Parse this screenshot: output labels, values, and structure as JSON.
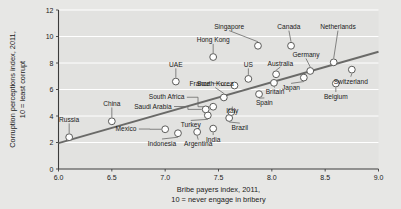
{
  "chart_data": {
    "type": "scatter",
    "title": "",
    "xlabel": "Bribe payers index, 2011,\n10 = never engage in bribery",
    "xlabel_line1": "Bribe payers index, 2011,",
    "xlabel_line2": "10 = never engage in bribery",
    "ylabel_line1": "Corruption perceptions index, 2011,",
    "ylabel_line2": "10 = least corrupt",
    "xlim": [
      6.0,
      9.0
    ],
    "ylim": [
      0,
      12
    ],
    "xticks": [
      "6.0",
      "6.5",
      "7.0",
      "7.5",
      "8.0",
      "8.5",
      "9.0"
    ],
    "xtick_values": [
      6.0,
      6.5,
      7.0,
      7.5,
      8.0,
      8.5,
      9.0
    ],
    "yticks": [
      "0",
      "2",
      "4",
      "6",
      "8",
      "10",
      "12"
    ],
    "ytick_values": [
      0,
      2,
      4,
      6,
      8,
      10,
      12
    ],
    "grid": "horizontal-white",
    "legend": "none",
    "plot_bg": "#e2e2e0",
    "marker_fill": "#ffffff",
    "marker_stroke": "#5a5a58",
    "trendline_color": "#6a6a68",
    "trendline": {
      "x0": 6.0,
      "y0": 1.95,
      "x1": 9.0,
      "y1": 8.85
    },
    "points": [
      {
        "label": "Russia",
        "x": 6.1,
        "y": 2.4,
        "lx": 6.1,
        "ly": 3.55,
        "anchor": "middle"
      },
      {
        "label": "China",
        "x": 6.5,
        "y": 3.6,
        "lx": 6.5,
        "ly": 4.75,
        "anchor": "middle"
      },
      {
        "label": "Mexico",
        "x": 7.0,
        "y": 3.0,
        "lx": 6.73,
        "ly": 2.85,
        "anchor": "end"
      },
      {
        "label": "Indonesia",
        "x": 7.12,
        "y": 2.7,
        "lx": 6.97,
        "ly": 1.75,
        "anchor": "middle"
      },
      {
        "label": "Argentina",
        "x": 7.3,
        "y": 2.8,
        "lx": 7.31,
        "ly": 1.7,
        "anchor": "middle"
      },
      {
        "label": "India",
        "x": 7.45,
        "y": 3.05,
        "lx": 7.45,
        "ly": 2.05,
        "anchor": "middle"
      },
      {
        "label": "Turkey",
        "x": 7.4,
        "y": 4.05,
        "lx": 7.24,
        "ly": 3.15,
        "anchor": "middle"
      },
      {
        "label": "Saudi Arabia",
        "x": 7.38,
        "y": 4.5,
        "lx": 7.06,
        "ly": 4.55,
        "anchor": "end"
      },
      {
        "label": "South Africa",
        "x": 7.45,
        "y": 4.7,
        "lx": 7.18,
        "ly": 5.25,
        "anchor": "end"
      },
      {
        "label": "Brazil",
        "x": 7.6,
        "y": 3.85,
        "lx": 7.7,
        "ly": 2.95,
        "anchor": "middle"
      },
      {
        "label": "Italy",
        "x": 7.62,
        "y": 4.3,
        "lx": 7.63,
        "ly": 4.2,
        "anchor": "middle"
      },
      {
        "label": "South Korea",
        "x": 7.55,
        "y": 5.4,
        "lx": 7.47,
        "ly": 6.25,
        "anchor": "middle"
      },
      {
        "label": "Spain",
        "x": 7.88,
        "y": 5.65,
        "lx": 7.93,
        "ly": 4.85,
        "anchor": "middle"
      },
      {
        "label": "France",
        "x": 7.65,
        "y": 6.3,
        "lx": 7.42,
        "ly": 6.3,
        "anchor": "end"
      },
      {
        "label": "UAE",
        "x": 7.1,
        "y": 6.6,
        "lx": 7.1,
        "ly": 7.7,
        "anchor": "middle"
      },
      {
        "label": "Hong Kong",
        "x": 7.45,
        "y": 8.45,
        "lx": 7.45,
        "ly": 9.55,
        "anchor": "middle"
      },
      {
        "label": "US",
        "x": 7.78,
        "y": 6.8,
        "lx": 7.78,
        "ly": 7.7,
        "anchor": "middle"
      },
      {
        "label": "Britain",
        "x": 8.02,
        "y": 6.5,
        "lx": 8.03,
        "ly": 5.65,
        "anchor": "middle"
      },
      {
        "label": "Australia",
        "x": 8.04,
        "y": 7.15,
        "lx": 8.08,
        "ly": 7.8,
        "anchor": "middle"
      },
      {
        "label": "Japan",
        "x": 8.3,
        "y": 6.9,
        "lx": 8.18,
        "ly": 5.95,
        "anchor": "middle"
      },
      {
        "label": "Singapore",
        "x": 7.87,
        "y": 9.3,
        "lx": 7.6,
        "ly": 10.55,
        "anchor": "middle"
      },
      {
        "label": "Canada",
        "x": 8.18,
        "y": 9.3,
        "lx": 8.16,
        "ly": 10.55,
        "anchor": "middle"
      },
      {
        "label": "Germany",
        "x": 8.36,
        "y": 7.4,
        "lx": 8.32,
        "ly": 8.45,
        "anchor": "middle"
      },
      {
        "label": "Netherlands",
        "x": 8.58,
        "y": 8.05,
        "lx": 8.62,
        "ly": 10.55,
        "anchor": "middle"
      },
      {
        "label": "Belgium",
        "x": 8.6,
        "y": 6.45,
        "lx": 8.6,
        "ly": 5.3,
        "anchor": "middle"
      },
      {
        "label": "Switzerland",
        "x": 8.75,
        "y": 7.5,
        "lx": 8.74,
        "ly": 6.45,
        "anchor": "middle"
      }
    ]
  }
}
